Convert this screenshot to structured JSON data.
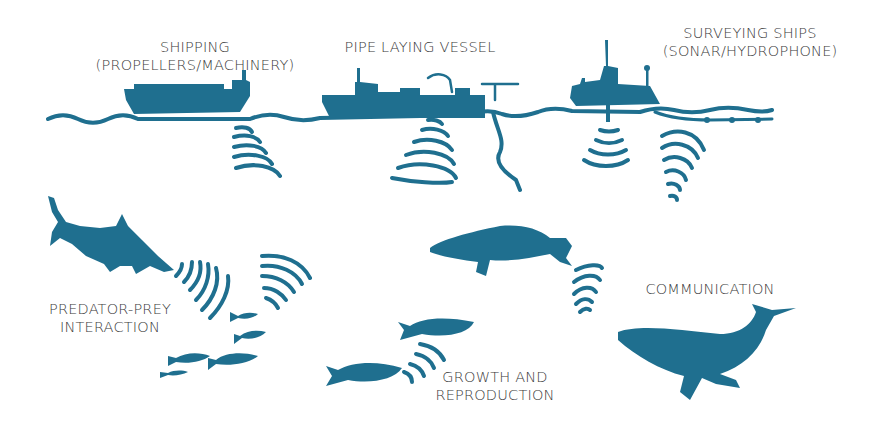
{
  "diagram": {
    "type": "illustration",
    "theme_color": "#1f6f8f",
    "text_color": "#3a3a3a",
    "sources": [
      {
        "id": "shipping",
        "lines": [
          "SHIPPING",
          "(PROPELLERS/MACHINERY)"
        ],
        "icon": "cargo-ship"
      },
      {
        "id": "pipe-laying",
        "lines": [
          "PIPE LAYING VESSEL"
        ],
        "icon": "pipe-laying-vessel"
      },
      {
        "id": "surveying",
        "lines": [
          "SURVEYING SHIPS",
          "(SONAR/HYDROPHONE)"
        ],
        "icon": "survey-ship"
      }
    ],
    "impacts": [
      {
        "id": "predator-prey",
        "lines": [
          "PREDATOR-PREY",
          "INTERACTION"
        ],
        "icons": [
          "shark",
          "fish-school"
        ]
      },
      {
        "id": "growth",
        "lines": [
          "GROWTH AND",
          "REPRODUCTION"
        ],
        "icons": [
          "salmon",
          "salmon"
        ]
      },
      {
        "id": "communication",
        "lines": [
          "COMMUNICATION"
        ],
        "icons": [
          "humpback-whale",
          "humpback-whale"
        ]
      }
    ]
  }
}
